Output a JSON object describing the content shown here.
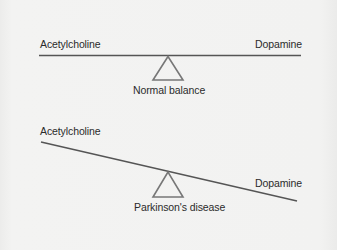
{
  "figure": {
    "panels": [
      {
        "name": "normal",
        "left_label": "Acetylcholine",
        "right_label": "Dopamine",
        "caption": "Normal balance",
        "state": "balanced"
      },
      {
        "name": "parkinsons",
        "left_label": "Acetylcholine",
        "right_label": "Dopamine",
        "caption": "Parkinson's disease",
        "state": "tilted-toward-dopamine-side-down"
      }
    ],
    "colors": {
      "background": "#f1f1f0",
      "beam": "#555555",
      "fulcrum": "#777777",
      "text": "#2b2b2b"
    }
  }
}
